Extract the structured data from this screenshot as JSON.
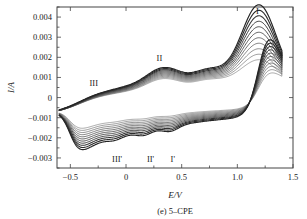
{
  "figure": {
    "caption": "(e) 5–CPE",
    "ylabel": "I/A",
    "xlabel": "E/V"
  },
  "chart_data": {
    "type": "line",
    "title": "(e) 5–CPE",
    "xlabel": "E/V",
    "ylabel": "I/A",
    "xlim": [
      -0.62,
      1.5
    ],
    "ylim": [
      -0.0035,
      0.0045
    ],
    "xticks": [
      -0.5,
      0,
      0.5,
      1.0,
      1.5
    ],
    "xticklabels": [
      "−0.5",
      "0",
      "0.5",
      "1.0",
      "1.5"
    ],
    "yticks": [
      0.004,
      0.003,
      0.002,
      0.001,
      0,
      -0.001,
      -0.002,
      -0.003
    ],
    "yticklabels": [
      "0.004",
      "0.003",
      "0.002",
      "0.001",
      "0",
      "−0.001",
      "−0.002",
      "−0.003"
    ],
    "grid": false,
    "legend": false,
    "n_series": 11,
    "series_description": "Cyclic voltammograms at increasing scan rates; each successive curve has larger anodic and cathodic currents.",
    "annotations": [
      {
        "text": "I",
        "x": 1.18,
        "y": 0.00415
      },
      {
        "text": "II",
        "x": 0.3,
        "y": 0.0018
      },
      {
        "text": "III",
        "x": -0.29,
        "y": 0.00055
      },
      {
        "text": "III'",
        "x": -0.08,
        "y": -0.00318
      },
      {
        "text": "II'",
        "x": 0.22,
        "y": -0.00322
      },
      {
        "text": "I'",
        "x": 0.42,
        "y": -0.00322
      }
    ],
    "anodic_peaks": [
      {
        "name": "I",
        "potential": 1.2,
        "current_range": [
          0.00112,
          0.00385
        ]
      },
      {
        "name": "II",
        "potential": 0.3,
        "current_range": [
          0.00045,
          0.0014
        ]
      },
      {
        "name": "III",
        "potential": -0.29,
        "current_range": [
          -0.0006,
          0.00015
        ]
      }
    ],
    "cathodic_peaks": [
      {
        "name": "I'",
        "potential": 0.4,
        "current_range": [
          -0.0004,
          -0.003
        ]
      },
      {
        "name": "II'",
        "potential": 0.16,
        "current_range": [
          -0.00035,
          -0.0025
        ]
      },
      {
        "name": "III'",
        "potential": -0.1,
        "current_range": [
          -0.0003,
          -0.0023
        ]
      }
    ],
    "switching_potentials": [
      -0.6,
      1.4
    ],
    "colors": {
      "curve": "#3a3a3a",
      "frame": "#444444",
      "background": "#ffffff"
    }
  }
}
